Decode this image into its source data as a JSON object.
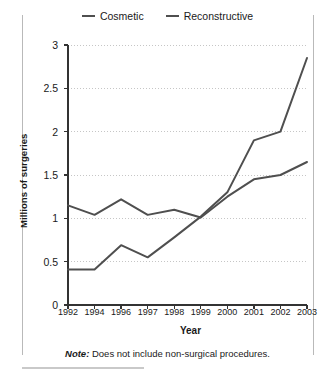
{
  "figure": {
    "note_prefix": "Note:",
    "note_text": " Does not include non-surgical procedures."
  },
  "chart_data": {
    "type": "line",
    "title": "",
    "xlabel": "Year",
    "ylabel": "Millions of surgeries",
    "categories": [
      "1992",
      "1994",
      "1996",
      "1997",
      "1998",
      "1999",
      "2000",
      "2001",
      "2002",
      "2003"
    ],
    "x": [
      1992,
      1994,
      1996,
      1997,
      1998,
      1999,
      2000,
      2001,
      2002,
      2003
    ],
    "series": [
      {
        "name": "Cosmetic",
        "color": "#4f4f4f",
        "values": [
          0.41,
          0.41,
          0.69,
          0.55,
          0.78,
          1.02,
          1.3,
          1.9,
          2.0,
          2.85
        ]
      },
      {
        "name": "Reconstructive",
        "color": "#4f4f4f",
        "values": [
          1.15,
          1.04,
          1.22,
          1.04,
          1.1,
          1.01,
          1.25,
          1.45,
          1.5,
          1.65
        ]
      }
    ],
    "ylim": [
      0,
      3
    ],
    "yticks": [
      0,
      0.5,
      1,
      1.5,
      2,
      2.5,
      3
    ],
    "ytick_labels": [
      "0",
      "0.5",
      "1",
      "1.5",
      "2",
      "2.5",
      "3"
    ],
    "grid": true,
    "grid_axis": "y",
    "legend_position": "top-center"
  }
}
